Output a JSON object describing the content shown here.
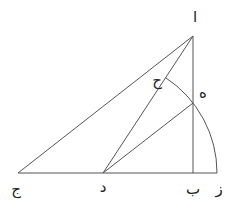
{
  "diagram": {
    "points": {
      "alif": {
        "label": "ا"
      },
      "ba": {
        "label": "ب"
      },
      "jim": {
        "label": "ج"
      },
      "dal": {
        "label": "د"
      },
      "ha": {
        "label": "ه"
      },
      "zay": {
        "label": "ز"
      },
      "hha": {
        "label": "ح"
      }
    },
    "segments": [
      "ا-ج",
      "ا-د",
      "ا-ب",
      "ج-ز",
      "د-ه"
    ],
    "arc": {
      "center": "د",
      "from": "ز",
      "to": "ح",
      "through": "ه"
    }
  }
}
